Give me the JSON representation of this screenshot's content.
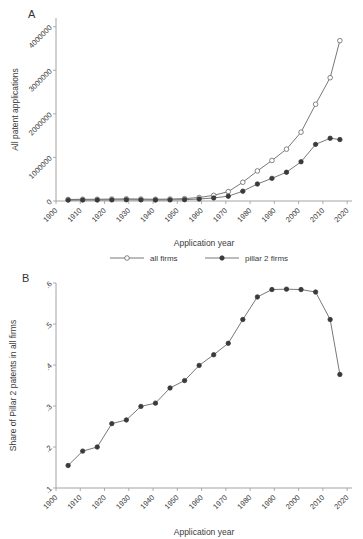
{
  "figure": {
    "panel_a_letter": "A",
    "panel_b_letter": "B"
  },
  "chart_data": [
    {
      "panel": "A",
      "type": "line",
      "title": "",
      "xlabel": "Application year",
      "ylabel": "All patent applications",
      "xlim": [
        1900,
        2022
      ],
      "ylim": [
        0,
        4200000
      ],
      "xticks": [
        "1900",
        "1910",
        "1920",
        "1930",
        "1940",
        "1950",
        "1960",
        "1970",
        "1980",
        "1990",
        "2000",
        "2010",
        "2020"
      ],
      "xtick_values": [
        1900,
        1910,
        1920,
        1930,
        1940,
        1950,
        1960,
        1970,
        1980,
        1990,
        2000,
        2010,
        2020
      ],
      "yticks": [
        "0",
        "1000000",
        "2000000",
        "3000000",
        "4000000"
      ],
      "ytick_values": [
        0,
        1000000,
        2000000,
        3000000,
        4000000
      ],
      "grid": false,
      "legend_position": "below",
      "x": [
        1905,
        1911,
        1917,
        1923,
        1929,
        1935,
        1941,
        1947,
        1953,
        1959,
        1965,
        1971,
        1977,
        1983,
        1989,
        1995,
        2001,
        2007,
        2013,
        2017
      ],
      "series": [
        {
          "name": "all firms",
          "marker": "open-circle",
          "values": [
            35000,
            40000,
            40000,
            45000,
            50000,
            45000,
            40000,
            45000,
            55000,
            80000,
            130000,
            215000,
            430000,
            690000,
            930000,
            1190000,
            1580000,
            2220000,
            2830000,
            3680000
          ]
        },
        {
          "name": "pillar 2 firms",
          "marker": "filled-circle",
          "values": [
            20000,
            22000,
            22000,
            25000,
            28000,
            25000,
            22000,
            25000,
            30000,
            45000,
            70000,
            110000,
            225000,
            390000,
            520000,
            660000,
            900000,
            1300000,
            1440000,
            1410000
          ]
        }
      ]
    },
    {
      "panel": "B",
      "type": "line",
      "title": "",
      "xlabel": "Application year",
      "ylabel": "Share of Pillar 2 patents in all firms",
      "xlim": [
        1900,
        2022
      ],
      "ylim": [
        0.1,
        0.6
      ],
      "xticks": [
        "1900",
        "1910",
        "1920",
        "1930",
        "1940",
        "1950",
        "1960",
        "1970",
        "1980",
        "1990",
        "2000",
        "2010",
        "2020"
      ],
      "xtick_values": [
        1900,
        1910,
        1920,
        1930,
        1940,
        1950,
        1960,
        1970,
        1980,
        1990,
        2000,
        2010,
        2020
      ],
      "yticks": [
        ".1",
        ".2",
        ".3",
        ".4",
        ".5",
        ".6"
      ],
      "ytick_values": [
        0.1,
        0.2,
        0.3,
        0.4,
        0.5,
        0.6
      ],
      "grid": false,
      "legend_position": "none",
      "x": [
        1905,
        1911,
        1917,
        1923,
        1929,
        1935,
        1941,
        1947,
        1953,
        1959,
        1965,
        1971,
        1977,
        1983,
        1989,
        1995,
        2001,
        2007,
        2013,
        2017
      ],
      "series": [
        {
          "name": "Share of Pillar 2 patents in all firms",
          "marker": "filled-circle",
          "values": [
            0.155,
            0.19,
            0.2,
            0.257,
            0.266,
            0.299,
            0.307,
            0.344,
            0.362,
            0.399,
            0.425,
            0.453,
            0.511,
            0.566,
            0.584,
            0.585,
            0.584,
            0.578,
            0.511,
            0.377
          ]
        }
      ]
    }
  ],
  "legend": {
    "items": [
      {
        "label": "all firms",
        "marker": "open-circle"
      },
      {
        "label": "pillar 2 firms",
        "marker": "filled-circle"
      }
    ]
  }
}
